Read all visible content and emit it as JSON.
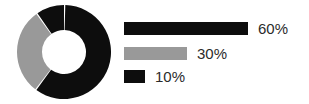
{
  "chart_data": {
    "type": "pie",
    "title": "",
    "subtitle": "",
    "xlabel": "",
    "ylabel": "",
    "variant": "donut",
    "legend_position": "right",
    "grid": false,
    "categories": [
      "60%",
      "30%",
      "10%"
    ],
    "values": [
      60,
      30,
      10
    ],
    "value_labels": [
      "60%",
      "30%",
      "10%"
    ],
    "slice_colors": [
      "#0d0d0d",
      "#999999",
      "#0d0d0d"
    ],
    "units": "percent",
    "total": 100,
    "slice_gap_color": "#ffffff",
    "inner_radius_ratio": 0.47,
    "series": [
      {
        "name": "share",
        "values": [
          60,
          30,
          10
        ]
      }
    ],
    "legend": [
      {
        "label": "60%",
        "value": 60,
        "color": "#0d0d0d"
      },
      {
        "label": "30%",
        "value": 30,
        "color": "#999999"
      },
      {
        "label": "10%",
        "value": 10,
        "color": "#0d0d0d"
      }
    ]
  },
  "donut": {
    "center_x": 47,
    "center_y": 47,
    "outer_radius": 47,
    "inner_radius": 22,
    "start_angle_deg": 0,
    "slices": [
      {
        "name": "slice-60",
        "value": 60,
        "color": "#0d0d0d",
        "start_deg": 1.6,
        "end_deg": 216.0
      },
      {
        "name": "slice-30",
        "value": 30,
        "color": "#999999",
        "start_deg": 217.6,
        "end_deg": 324.0
      },
      {
        "name": "slice-10",
        "value": 10,
        "color": "#0d0d0d",
        "start_deg": 325.6,
        "end_deg": 360.0
      }
    ]
  },
  "legend_bars": {
    "rows": [
      {
        "label": "60%",
        "bar_width_px": 124,
        "color": "#0d0d0d"
      },
      {
        "label": "30%",
        "bar_width_px": 63,
        "color": "#999999"
      },
      {
        "label": "10%",
        "bar_width_px": 21,
        "color": "#0d0d0d"
      }
    ]
  },
  "colors": {
    "background": "#ffffff",
    "dark": "#0d0d0d",
    "gray": "#999999",
    "text": "#2b2b2b"
  }
}
